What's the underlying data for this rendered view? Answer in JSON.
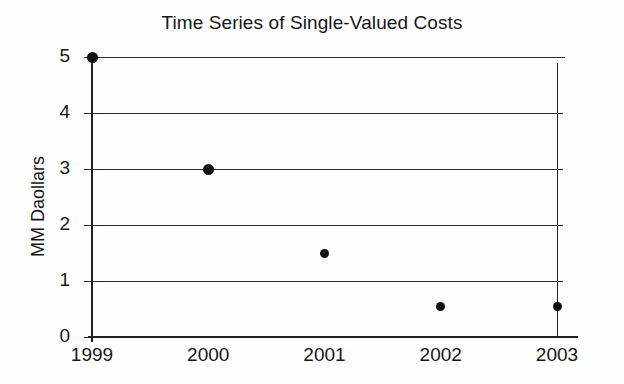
{
  "chart_data": {
    "type": "scatter",
    "title": "Time Series of Single-Valued Costs",
    "xlabel": "",
    "ylabel": "MM Daollars",
    "categories": [
      "1999",
      "2000",
      "2001",
      "2002",
      "2003"
    ],
    "x": [
      1999,
      2000,
      2001,
      2002,
      2003
    ],
    "values": [
      5.0,
      3.0,
      1.5,
      0.55,
      0.55
    ],
    "series": [
      {
        "name": "Single-Valued Cost",
        "values": [
          5.0,
          3.0,
          1.5,
          0.55,
          0.55
        ]
      }
    ],
    "ylim": [
      0,
      5
    ],
    "xlim": [
      1999,
      2003
    ],
    "ytick_labels": [
      "0",
      "1",
      "2",
      "3",
      "4",
      "5"
    ],
    "ytick_values": [
      0,
      1,
      2,
      3,
      4,
      5
    ],
    "grid": "horizontal",
    "legend": "none",
    "annotations": [
      {
        "kind": "vertical-range-line",
        "at_category": "2003",
        "low": 0.0,
        "high": 4.9
      }
    ],
    "marker": "filled-circle",
    "marker_color": "#111111",
    "grid_color": "#2b2b2b",
    "axis_color": "#222222",
    "background": "#fefefe"
  },
  "axis": {
    "y_ticks": [
      {
        "label": "5",
        "value": 5
      },
      {
        "label": "4",
        "value": 4
      },
      {
        "label": "3",
        "value": 3
      },
      {
        "label": "2",
        "value": 2
      },
      {
        "label": "1",
        "value": 1
      },
      {
        "label": "0",
        "value": 0
      }
    ],
    "x_ticks": [
      {
        "label": "1999"
      },
      {
        "label": "2000"
      },
      {
        "label": "2001"
      },
      {
        "label": "2002"
      },
      {
        "label": "2003"
      }
    ]
  }
}
